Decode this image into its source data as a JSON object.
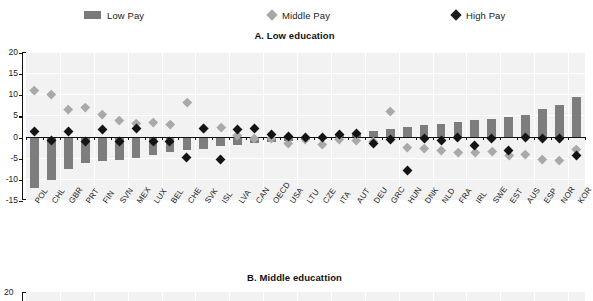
{
  "legend": {
    "items": [
      {
        "label": "Low Pay",
        "marker": "bar-swatch-icon",
        "color": "#7a7a7a",
        "left": 84
      },
      {
        "label": "Middle Pay",
        "marker": "diamond-mid-icon",
        "color": "#a8a8a8",
        "left": 268
      },
      {
        "label": "High Pay",
        "marker": "diamond-high-icon",
        "color": "#1c1c1c",
        "left": 452
      }
    ]
  },
  "panelA": {
    "title": "A. Low education"
  },
  "panelB": {
    "title": "B. Middle educattion",
    "ytop_label": "20"
  },
  "chart_data": {
    "type": "bar",
    "title": "A. Low education",
    "xlabel": "",
    "ylabel": "",
    "ylim": [
      -15,
      20
    ],
    "yticks": [
      20,
      15,
      10,
      5,
      0,
      -5,
      -10,
      -15
    ],
    "grid": true,
    "legend_position": "top",
    "categories": [
      "POL",
      "CHL",
      "GBR",
      "PRT",
      "FIN",
      "SVN",
      "MEX",
      "LUX",
      "BEL",
      "CHE",
      "SVK",
      "ISL",
      "LVA",
      "CAN",
      "OECD",
      "USA",
      "LTU",
      "CZE",
      "ITA",
      "AUT",
      "DEU",
      "GRC",
      "HUN",
      "DNK",
      "NLD",
      "FRA",
      "IRL",
      "SWE",
      "EST",
      "AUS",
      "ESP",
      "NOR",
      "KOR"
    ],
    "series": [
      {
        "name": "Low Pay",
        "type": "bar",
        "color": "#7d7d7d",
        "values": [
          -12.2,
          -10.2,
          -7.6,
          -6.3,
          -5.7,
          -5.5,
          -5.0,
          -4.4,
          -3.6,
          -3.1,
          -3.0,
          -2.2,
          -1.9,
          -1.6,
          -1.3,
          -1.0,
          -0.8,
          -0.5,
          0.4,
          0.9,
          1.3,
          1.9,
          2.3,
          2.7,
          3.0,
          3.4,
          3.9,
          4.1,
          4.6,
          5.2,
          6.5,
          7.4,
          9.4
        ]
      },
      {
        "name": "Middle Pay",
        "type": "scatter",
        "color": "#a9a9a9",
        "values": [
          11.0,
          10.0,
          6.4,
          7.0,
          5.3,
          3.9,
          3.2,
          3.5,
          3.0,
          8.2,
          2.0,
          2.2,
          0.2,
          -0.3,
          -0.5,
          -1.5,
          -0.6,
          -1.8,
          -0.7,
          -0.9,
          -1.1,
          5.9,
          -2.5,
          -2.8,
          -3.2,
          -3.6,
          -3.6,
          -3.5,
          -4.3,
          -4.1,
          -5.3,
          -5.6,
          -2.9
        ]
      },
      {
        "name": "High Pay",
        "type": "scatter",
        "color": "#141414",
        "values": [
          1.2,
          -1.0,
          1.1,
          -1.1,
          1.7,
          -1.2,
          1.8,
          -1.1,
          -1.2,
          -4.9,
          2.0,
          -5.4,
          1.7,
          1.8,
          0.5,
          0.1,
          -0.3,
          -0.2,
          0.6,
          0.8,
          -1.6,
          -0.6,
          -8.0,
          -0.5,
          -1.0,
          -0.3,
          -2.0,
          -0.4,
          -3.4,
          -0.2,
          -0.5,
          -0.4,
          -4.5
        ]
      }
    ]
  }
}
